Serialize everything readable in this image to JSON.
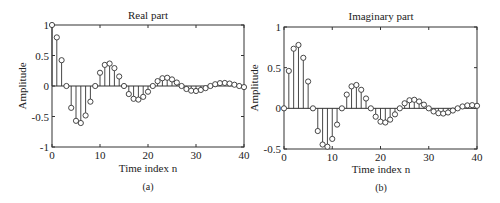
{
  "chart_data": [
    {
      "type": "stem",
      "panel_label": "(a)",
      "title": "Real part",
      "xlabel": "Time index n",
      "ylabel": "Amplitude",
      "xlim": [
        0,
        40
      ],
      "ylim": [
        -1,
        1
      ],
      "xticks": [
        0,
        10,
        20,
        30,
        40
      ],
      "yticks": [
        -1,
        -0.5,
        0,
        0.5,
        1
      ],
      "ytick_labels": [
        "-1",
        "-0.5",
        "0",
        "0.5",
        "1"
      ],
      "grid": false,
      "x": [
        0,
        1,
        2,
        3,
        4,
        5,
        6,
        7,
        8,
        9,
        10,
        11,
        12,
        13,
        14,
        15,
        16,
        17,
        18,
        19,
        20,
        21,
        22,
        23,
        24,
        25,
        26,
        27,
        28,
        29,
        30,
        31,
        32,
        33,
        34,
        35,
        36,
        37,
        38,
        39,
        40
      ],
      "values": [
        1.0,
        0.797,
        0.423,
        0.0,
        -0.358,
        -0.571,
        -0.607,
        -0.483,
        -0.257,
        0.0,
        0.217,
        0.346,
        0.368,
        0.293,
        0.156,
        0.0,
        -0.132,
        -0.21,
        -0.223,
        -0.178,
        -0.094,
        0.0,
        0.08,
        0.127,
        0.135,
        0.108,
        0.057,
        0.0,
        -0.049,
        -0.077,
        -0.082,
        -0.065,
        -0.035,
        0.0,
        0.029,
        0.047,
        0.05,
        0.04,
        0.021,
        0.0,
        -0.018
      ]
    },
    {
      "type": "stem",
      "panel_label": "(b)",
      "title": "Imaginary part",
      "xlabel": "Time index n",
      "ylabel": "Amplitude",
      "xlim": [
        0,
        40
      ],
      "ylim": [
        -0.5,
        1
      ],
      "xticks": [
        0,
        10,
        20,
        30,
        40
      ],
      "yticks": [
        -0.5,
        0,
        0.5,
        1
      ],
      "ytick_labels": [
        "-0.5",
        "0",
        "0.5",
        "1"
      ],
      "grid": false,
      "x": [
        0,
        1,
        2,
        3,
        4,
        5,
        6,
        7,
        8,
        9,
        10,
        11,
        12,
        13,
        14,
        15,
        16,
        17,
        18,
        19,
        20,
        21,
        22,
        23,
        24,
        25,
        26,
        27,
        28,
        29,
        30,
        31,
        32,
        33,
        34,
        35,
        36,
        37,
        38,
        39,
        40
      ],
      "values": [
        0.0,
        0.46,
        0.733,
        0.779,
        0.621,
        0.33,
        0.0,
        -0.279,
        -0.445,
        -0.472,
        -0.376,
        -0.2,
        0.0,
        0.169,
        0.27,
        0.287,
        0.228,
        0.121,
        0.0,
        -0.103,
        -0.164,
        -0.174,
        -0.139,
        -0.074,
        0.0,
        0.062,
        0.099,
        0.105,
        0.084,
        0.045,
        0.0,
        -0.038,
        -0.06,
        -0.064,
        -0.051,
        -0.027,
        0.0,
        0.023,
        0.036,
        0.039,
        0.031
      ]
    }
  ],
  "panels": {
    "a": {
      "title": "Real part",
      "xlabel": "Time index n",
      "ylabel": "Amplitude",
      "caption": "(a)"
    },
    "b": {
      "title": "Imaginary part",
      "xlabel": "Time index n",
      "ylabel": "Amplitude",
      "caption": "(b)"
    }
  },
  "style": {
    "line_color": "#333333",
    "marker_fill": "#ffffff",
    "background": "#ffffff"
  }
}
